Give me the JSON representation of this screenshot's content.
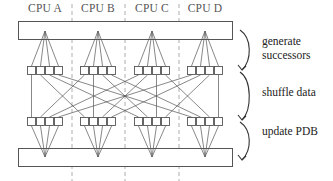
{
  "diagram": {
    "cpus": [
      {
        "label": "CPU A",
        "center_x": 45
      },
      {
        "label": "CPU B",
        "center_x": 98
      },
      {
        "label": "CPU C",
        "center_x": 152
      },
      {
        "label": "CPU D",
        "center_x": 205
      }
    ],
    "phases": [
      {
        "line1": "generate",
        "line2": "successors"
      },
      {
        "line1": "shuffle data",
        "line2": ""
      },
      {
        "line1": "update PDB",
        "line2": ""
      }
    ],
    "colors": {
      "stroke": "#555555",
      "dash": "#999999",
      "text": "#222222"
    },
    "buffers_per_cpu": 4
  }
}
